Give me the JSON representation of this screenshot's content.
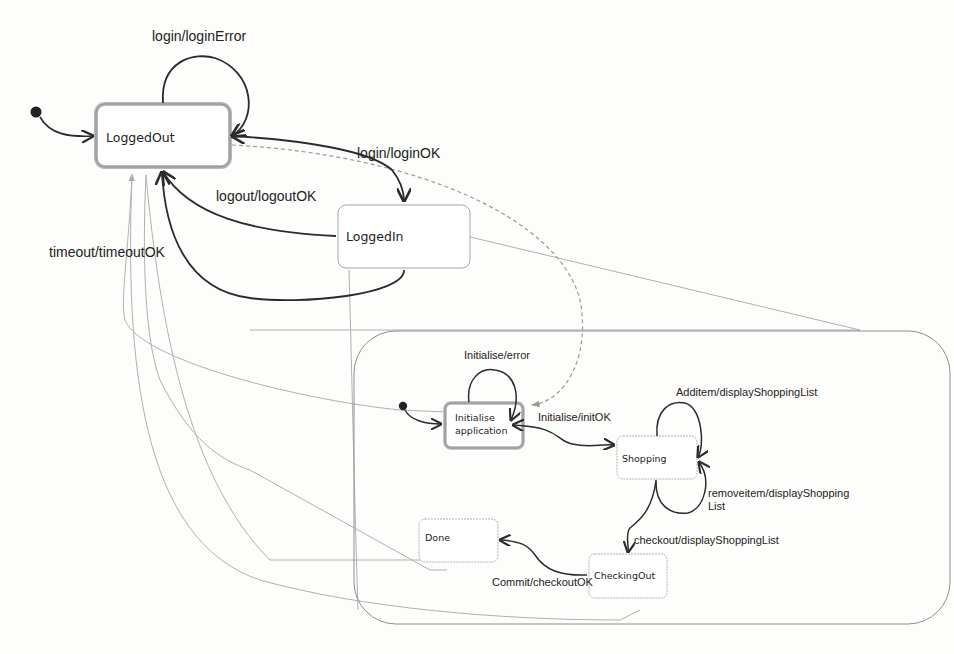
{
  "diagram": {
    "type": "UML state machine",
    "states": [
      {
        "id": "loggedout",
        "label": "LoggedOut",
        "initial": true
      },
      {
        "id": "loggedin",
        "label": "LoggedIn"
      },
      {
        "id": "composite",
        "label": "",
        "children": [
          "init",
          "shopping",
          "checkingout",
          "done"
        ]
      },
      {
        "id": "init",
        "label_line1": "Initialise",
        "label_line2": "application",
        "initial": true
      },
      {
        "id": "shopping",
        "label": "Shopping"
      },
      {
        "id": "checkingout",
        "label": "CheckingOut"
      },
      {
        "id": "done",
        "label": "Done"
      }
    ],
    "transitions": [
      {
        "id": "t_login_error",
        "from": "loggedout",
        "to": "loggedout",
        "label": "login/loginError"
      },
      {
        "id": "t_login_ok",
        "from": "loggedout",
        "to": "loggedin",
        "label": "login/loginOK"
      },
      {
        "id": "t_logout",
        "from": "loggedin",
        "to": "loggedout",
        "label": "logout/logoutOK"
      },
      {
        "id": "t_timeout",
        "from": "loggedin",
        "to": "loggedout",
        "label": "timeout/timeoutOK"
      },
      {
        "id": "t_init_error",
        "from": "init",
        "to": "init",
        "label": "Initialise/error"
      },
      {
        "id": "t_init_ok",
        "from": "init",
        "to": "shopping",
        "label": "Initialise/initOK"
      },
      {
        "id": "t_additem",
        "from": "shopping",
        "to": "shopping",
        "label": "Additem/displayShoppingList"
      },
      {
        "id": "t_removeitem",
        "from": "shopping",
        "to": "shopping",
        "label_line1": "removeitem/displayShopping",
        "label_line2": "List"
      },
      {
        "id": "t_checkout",
        "from": "shopping",
        "to": "checkingout",
        "label": "checkout/displayShoppingList"
      },
      {
        "id": "t_commit",
        "from": "checkingout",
        "to": "done",
        "label": "Commit/checkoutOK"
      }
    ]
  },
  "colors": {
    "stroke": "#2b2b2b",
    "faint": "#a8a8a8",
    "state_border": "#9a9a9a",
    "highlight_border": "#b5b5b5",
    "background": "#fdfdfc"
  }
}
